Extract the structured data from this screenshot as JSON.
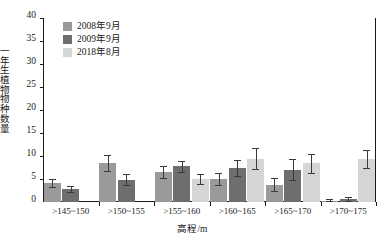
{
  "chart_data": {
    "type": "bar",
    "title": "",
    "xlabel": "高程/m",
    "ylabel": "一年生植物物种数量",
    "ylim": [
      0,
      40
    ],
    "yticks": [
      0,
      5,
      10,
      15,
      20,
      25,
      30,
      35,
      40
    ],
    "grid": false,
    "legend_position": "top-left",
    "categories": [
      ">145~150",
      ">150~155",
      ">155~160",
      ">160~165",
      ">165~170",
      ">170~175"
    ],
    "series": [
      {
        "name": "2008年9月",
        "color": "#9a9a9a",
        "values": [
          4.2,
          8.5,
          6.5,
          5.0,
          3.8,
          0.2
        ],
        "errors": [
          0.9,
          1.7,
          1.3,
          1.4,
          1.4,
          0.4
        ]
      },
      {
        "name": "2009年9月",
        "color": "#6e6e6e",
        "values": [
          2.8,
          4.8,
          7.8,
          7.4,
          7.0,
          0.7
        ],
        "errors": [
          0.6,
          1.2,
          1.2,
          1.7,
          2.3,
          0.4
        ]
      },
      {
        "name": "2018年8月",
        "color": "#d5d5d5",
        "values": [
          0,
          0,
          5.0,
          9.4,
          8.4,
          9.4
        ],
        "errors": [
          0,
          0,
          1.1,
          2.3,
          2.1,
          2.0
        ]
      }
    ]
  },
  "axis": {
    "ytick_labels": [
      "0",
      "5",
      "10",
      "15",
      "20",
      "25",
      "30",
      "35",
      "40"
    ],
    "ylabel_chars": [
      "一",
      "年",
      "生",
      "植",
      "物",
      "物",
      "种",
      "数",
      "量"
    ]
  }
}
